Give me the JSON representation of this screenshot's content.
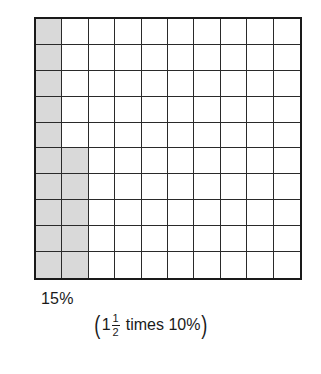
{
  "diagram": {
    "type": "hundred-grid",
    "rows": 10,
    "cols": 10,
    "shaded_cells": {
      "column_1": "all 10 rows",
      "column_2": "bottom 5 rows"
    },
    "shaded_count": 15,
    "shade_color": "#d9d9d9",
    "line_color": "#1a1a1a"
  },
  "labels": {
    "percent": "15%",
    "caption": {
      "open_paren": "(",
      "whole": "1",
      "fraction_numerator": "1",
      "fraction_denominator": "2",
      "text": "times 10%",
      "close_paren": ")"
    }
  }
}
